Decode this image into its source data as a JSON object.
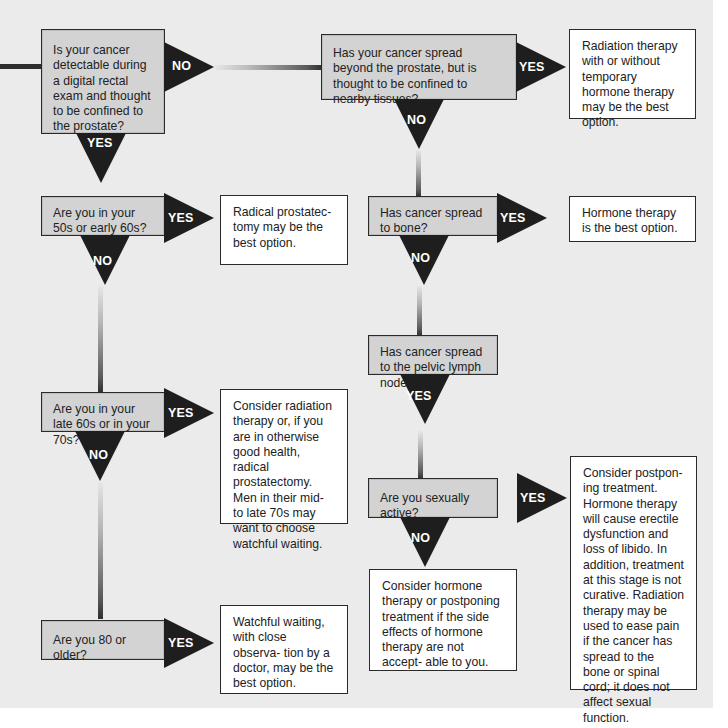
{
  "flowchart": {
    "questions": [
      {
        "id": "q1",
        "text": "Is your cancer detectable during a digital rectal exam and thought to be confined to the prostate?"
      },
      {
        "id": "q2",
        "text": "Are you in your 50s or early 60s?"
      },
      {
        "id": "q3",
        "text": "Are you in your late 60s or in your 70s?"
      },
      {
        "id": "q4",
        "text": "Are you 80 or older?"
      },
      {
        "id": "q5",
        "text": "Has your cancer spread beyond the prostate, but is thought to be confined to nearby tissues?"
      },
      {
        "id": "q6",
        "text": "Has cancer spread to bone?"
      },
      {
        "id": "q7",
        "text": "Has cancer spread to the pelvic lymph nodes?"
      },
      {
        "id": "q8",
        "text": "Are you sexually active?"
      }
    ],
    "answers": [
      {
        "id": "a_q2_yes",
        "text": "Radical prostatec- tomy may be the best option."
      },
      {
        "id": "a_q3_yes",
        "text": "Consider radiation therapy or, if you are in otherwise good health, radical prostatectomy. Men in their mid- to late 70s may want to choose watchful waiting."
      },
      {
        "id": "a_q4_yes",
        "text": "Watchful waiting, with close observa- tion by a doctor, may be the best option."
      },
      {
        "id": "a_q5_yes",
        "text": "Radiation therapy with or without temporary hormone therapy may be the best option."
      },
      {
        "id": "a_q6_yes",
        "text": "Hormone therapy is the best option."
      },
      {
        "id": "a_q8_yes",
        "text": "Consider postpon- ing treatment. Hormone therapy will cause erectile dysfunction and loss of libido. In addition, treatment at this stage is not curative. Radiation therapy may be used to ease pain if the cancer has spread to the bone or spinal cord; it does not affect sexual function."
      },
      {
        "id": "a_q8_no",
        "text": "Consider hormone therapy or postponing treatment if the side effects of hormone therapy are not accept- able to you."
      }
    ],
    "labels": {
      "yes": "YES",
      "no": "NO"
    },
    "colors": {
      "background": "#ebebeb",
      "question_fill": "#d3d3d3",
      "answer_fill": "#ffffff",
      "arrow": "#1e1e1e",
      "border": "#2a2a2a"
    }
  }
}
